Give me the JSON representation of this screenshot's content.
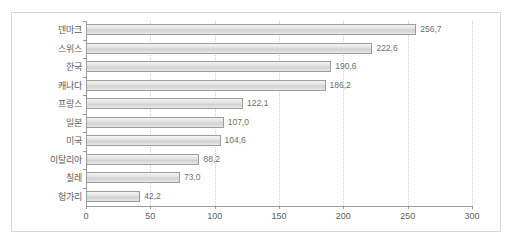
{
  "header": {
    "left_text": "",
    "right_text": ""
  },
  "chart_data": {
    "type": "bar",
    "orientation": "horizontal",
    "title": "",
    "subtitle": "",
    "xlabel": "",
    "ylabel": "",
    "categories": [
      "덴마크",
      "스위스",
      "한국",
      "캐나다",
      "프랑스",
      "일본",
      "미국",
      "이탈리아",
      "칠레",
      "헝가리"
    ],
    "values": [
      256.7,
      222.6,
      190.6,
      186.2,
      122.1,
      107.0,
      104.6,
      88.2,
      73.0,
      42.2
    ],
    "value_labels": [
      "256,7",
      "222,6",
      "190,6",
      "186,2",
      "122,1",
      "107,0",
      "104,6",
      "88,2",
      "73,0",
      "42,2"
    ],
    "xlim": [
      0,
      300
    ],
    "xticks": [
      0,
      50,
      100,
      150,
      200,
      250,
      300
    ],
    "xtick_labels": [
      "0",
      "50",
      "100",
      "150",
      "200",
      "250",
      "300"
    ],
    "grid": true,
    "grid_style": "dotted-vertical",
    "legend": null,
    "bar_color": "#dcdcdc",
    "bar_border_color": "#9d9d9d",
    "axis_color": "#9a9a9a",
    "grid_color": "#cfcfcf",
    "text_color": "#5d5d5d"
  }
}
